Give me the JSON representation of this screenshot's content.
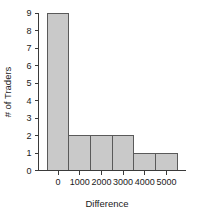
{
  "chart_data": {
    "type": "bar",
    "title": "",
    "subtitle": "",
    "xlabel": "Difference",
    "ylabel": "# of Traders",
    "categories": [
      "0",
      "1000",
      "2000",
      "3000",
      "4000",
      "5000"
    ],
    "values": [
      9,
      2,
      2,
      2,
      1,
      1
    ],
    "bin_centers": [
      0,
      1000,
      2000,
      3000,
      4000,
      5000
    ],
    "bin_width": 1000,
    "bin_edges": [
      -500,
      500,
      1500,
      2500,
      3500,
      4500,
      5500
    ],
    "x_tick_labels": [
      "0",
      "1000",
      "2000",
      "3000",
      "4000",
      "5000"
    ],
    "x_tick_values": [
      0,
      1000,
      2000,
      3000,
      4000,
      5000
    ],
    "y_tick_labels": [
      "0",
      "1",
      "2",
      "3",
      "4",
      "5",
      "6",
      "7",
      "8",
      "9"
    ],
    "y_tick_values": [
      0,
      1,
      2,
      3,
      4,
      5,
      6,
      7,
      8,
      9
    ],
    "xlim": [
      -900,
      5900
    ],
    "ylim": [
      0,
      9
    ],
    "grid": false,
    "legend": false,
    "legend_position": "none",
    "bar_fill_color": "#c9c9c9",
    "bar_border_color": "#5a5a5a",
    "axis_color": "#3a3a3a",
    "text_color": "#1a1a1a",
    "background_color": "#ffffff"
  },
  "labels": {
    "x_axis_title": "Difference",
    "y_axis_title": "# of Traders"
  }
}
